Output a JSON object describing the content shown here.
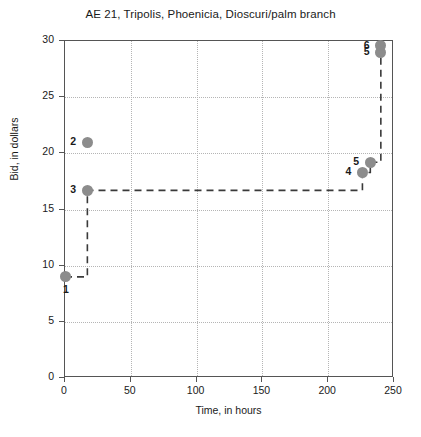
{
  "chart_data": {
    "type": "scatter",
    "title": "AE 21, Tripolis, Phoenicia, Dioscuri/palm branch",
    "xlabel": "Time, in hours",
    "ylabel": "Bid, in dollars",
    "xlim": [
      0,
      250
    ],
    "ylim": [
      0,
      30
    ],
    "xticks": [
      0,
      50,
      100,
      150,
      200,
      250
    ],
    "yticks": [
      0,
      5,
      10,
      15,
      20,
      25,
      30
    ],
    "grid": true,
    "legend": "none",
    "marker_color": "#8c8c8c",
    "step_line_color": "#3a3a3a",
    "step_line_style": "dashed",
    "points": [
      {
        "label": "1",
        "x": 0,
        "y": 9.0,
        "label_pos": "below"
      },
      {
        "label": "2",
        "x": 17,
        "y": 21.0,
        "label_pos": "left"
      },
      {
        "label": "3",
        "x": 17,
        "y": 16.7,
        "label_pos": "left"
      },
      {
        "label": "4",
        "x": 226,
        "y": 18.3,
        "label_pos": "left"
      },
      {
        "label": "5",
        "x": 232,
        "y": 19.2,
        "label_pos": "left"
      },
      {
        "label": "5",
        "x": 240,
        "y": 29.0,
        "label_pos": "left"
      },
      {
        "label": "6",
        "x": 240,
        "y": 29.6,
        "label_pos": "left"
      }
    ],
    "step_path": [
      {
        "x": 0,
        "y": 9.0
      },
      {
        "x": 17,
        "y": 9.0
      },
      {
        "x": 17,
        "y": 16.7
      },
      {
        "x": 226,
        "y": 16.7
      },
      {
        "x": 226,
        "y": 18.3
      },
      {
        "x": 232,
        "y": 18.3
      },
      {
        "x": 232,
        "y": 19.2
      },
      {
        "x": 240,
        "y": 19.2
      },
      {
        "x": 240,
        "y": 29.6
      }
    ]
  }
}
